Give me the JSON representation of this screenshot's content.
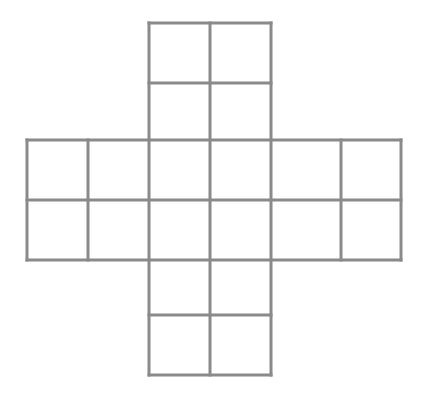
{
  "diagram": {
    "title": "",
    "type": "cross-shaped grid net",
    "stroke_color": "#8a8a8a",
    "stroke_width": 3,
    "background": "#ffffff",
    "cells": {
      "top_arm": {
        "rows": 2,
        "cols": 2
      },
      "middle_band": {
        "rows": 2,
        "cols": 6
      },
      "bottom_arm": {
        "rows": 2,
        "cols": 2
      }
    },
    "total_cells": 20,
    "segments": [
      [
        149,
        23,
        271,
        23
      ],
      [
        149,
        83,
        271,
        83
      ],
      [
        27,
        140,
        401,
        140
      ],
      [
        27,
        200,
        401,
        200
      ],
      [
        27,
        260,
        401,
        260
      ],
      [
        149,
        315,
        271,
        315
      ],
      [
        149,
        375,
        271,
        375
      ],
      [
        27,
        140,
        27,
        260
      ],
      [
        88,
        140,
        88,
        260
      ],
      [
        149,
        23,
        149,
        375
      ],
      [
        210,
        23,
        210,
        375
      ],
      [
        271,
        23,
        271,
        375
      ],
      [
        341,
        140,
        341,
        260
      ],
      [
        401,
        140,
        401,
        260
      ]
    ]
  }
}
